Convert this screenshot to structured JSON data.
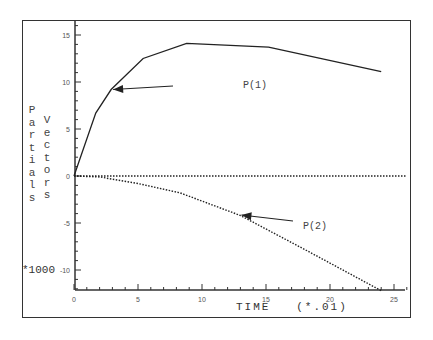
{
  "chart_data": {
    "type": "line",
    "title": "",
    "xlabel": "TIME (*.01)",
    "ylabel_left": "Partials",
    "ylabel_right": "Vectors",
    "y_multiplier": "*1000",
    "xlim": [
      0,
      26
    ],
    "ylim": [
      -12.5,
      16.5
    ],
    "x_ticks": [
      "0",
      "5",
      "10",
      "15",
      "20",
      "25"
    ],
    "y_ticks": [
      "15",
      "10",
      "5",
      "0",
      "-5",
      "-10"
    ],
    "grid": false,
    "series": [
      {
        "name": "P(1)",
        "style": "solid",
        "x": [
          0,
          1.7,
          2.9,
          5.4,
          8.8,
          15.2,
          24
        ],
        "y": [
          0,
          6.7,
          9.2,
          12.5,
          14.1,
          13.7,
          11.1
        ]
      },
      {
        "name": "P(2)",
        "style": "dotted",
        "x": [
          0,
          2,
          5,
          8.3,
          13,
          18,
          24
        ],
        "y": [
          0,
          -0.1,
          -0.8,
          -1.8,
          -4.2,
          -7.8,
          -12.2
        ]
      },
      {
        "name": "zero",
        "style": "dotted",
        "x": [
          0,
          26
        ],
        "y": [
          0,
          0
        ]
      }
    ],
    "annotations": [
      {
        "text": "P(1)",
        "arrow_to": [
          2.9,
          9.2
        ]
      },
      {
        "text": "P(2)",
        "arrow_to": [
          13,
          -4.2
        ]
      }
    ]
  },
  "labels": {
    "ylabel_left": "Partials",
    "ylabel_right": "Vectors",
    "multiplier": "*1000",
    "xtitle": "TIME   (*.01)",
    "p1": "P(1)",
    "p2": "P(2)"
  }
}
